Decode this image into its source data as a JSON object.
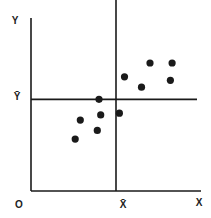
{
  "chart_data": {
    "type": "scatter",
    "title": "",
    "xlabel": "X",
    "ylabel": "Y",
    "origin_label": "O",
    "mean_x_label": "X̄",
    "mean_y_label": "Ȳ",
    "grid": false,
    "legend": null,
    "xlim": [
      0,
      10
    ],
    "ylim": [
      0,
      10
    ],
    "mean_x": 5.0,
    "mean_y": 5.3,
    "points": [
      {
        "x": 2.6,
        "y": 3.0
      },
      {
        "x": 2.9,
        "y": 4.1
      },
      {
        "x": 3.9,
        "y": 3.5
      },
      {
        "x": 4.1,
        "y": 4.4
      },
      {
        "x": 4.0,
        "y": 5.3
      },
      {
        "x": 5.2,
        "y": 4.5
      },
      {
        "x": 5.5,
        "y": 6.6
      },
      {
        "x": 6.5,
        "y": 6.0
      },
      {
        "x": 7.0,
        "y": 7.4
      },
      {
        "x": 8.2,
        "y": 6.4
      },
      {
        "x": 8.3,
        "y": 7.4
      }
    ]
  },
  "colors": {
    "ink": "#1a1a1a",
    "background": "#ffffff"
  }
}
